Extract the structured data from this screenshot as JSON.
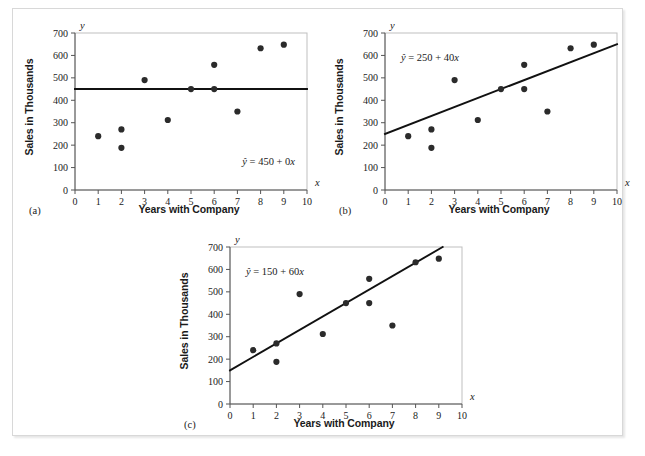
{
  "figure": {
    "panels": [
      {
        "tag": "(a)",
        "xlabel": "Years with Company",
        "ylabel": "Sales in Thousands",
        "x_axis_var": "x",
        "y_axis_var": "y",
        "equation_parts": {
          "yhat": "ŷ",
          "rest": " = 450 + 0",
          "var": "x"
        },
        "equation": "ŷ = 450 + 0x",
        "eq_pos": "bottom-right"
      },
      {
        "tag": "(b)",
        "xlabel": "Years with Company",
        "ylabel": "Sales in Thousands",
        "x_axis_var": "x",
        "y_axis_var": "y",
        "equation_parts": {
          "yhat": "ŷ",
          "rest": " = 250 + 40",
          "var": "x"
        },
        "equation": "ŷ = 250 + 40x",
        "eq_pos": "top-left"
      },
      {
        "tag": "(c)",
        "xlabel": "Years with Company",
        "ylabel": "Sales in Thousands",
        "x_axis_var": "x",
        "y_axis_var": "y",
        "equation_parts": {
          "yhat": "ŷ",
          "rest": " = 150 + 60",
          "var": "x"
        },
        "equation": "ŷ = 150 + 60x",
        "eq_pos": "top-left"
      }
    ]
  },
  "chart_data": [
    {
      "type": "scatter",
      "title": "",
      "subtitle": "(a)",
      "xlabel": "Years with Company",
      "ylabel": "Sales in Thousands",
      "xlim": [
        0,
        10
      ],
      "ylim": [
        0,
        700
      ],
      "xticks": [
        0,
        1,
        2,
        3,
        4,
        5,
        6,
        7,
        8,
        9,
        10
      ],
      "yticks": [
        0,
        100,
        200,
        300,
        400,
        500,
        600,
        700
      ],
      "grid": false,
      "legend": "none",
      "x": [
        1,
        2,
        2,
        3,
        4,
        5,
        6,
        6,
        7,
        8,
        9
      ],
      "y": [
        240,
        270,
        188,
        490,
        312,
        450,
        558,
        450,
        350,
        632,
        648
      ],
      "annotations": [
        "ŷ = 450 + 0x"
      ],
      "fit_line": {
        "label": "ŷ = 450 + 0x",
        "intercept": 450,
        "slope": 0,
        "x_start": 0,
        "x_end": 10,
        "y_start": 450,
        "y_end": 450
      }
    },
    {
      "type": "scatter",
      "title": "",
      "subtitle": "(b)",
      "xlabel": "Years with Company",
      "ylabel": "Sales in Thousands",
      "xlim": [
        0,
        10
      ],
      "ylim": [
        0,
        700
      ],
      "xticks": [
        0,
        1,
        2,
        3,
        4,
        5,
        6,
        7,
        8,
        9,
        10
      ],
      "yticks": [
        0,
        100,
        200,
        300,
        400,
        500,
        600,
        700
      ],
      "grid": false,
      "legend": "none",
      "x": [
        1,
        2,
        2,
        3,
        4,
        5,
        6,
        6,
        7,
        8,
        9
      ],
      "y": [
        240,
        270,
        188,
        490,
        312,
        450,
        558,
        450,
        350,
        632,
        648
      ],
      "annotations": [
        "ŷ = 250 + 40x"
      ],
      "fit_line": {
        "label": "ŷ = 250 + 40x",
        "intercept": 250,
        "slope": 40,
        "x_start": 0,
        "x_end": 10,
        "y_start": 250,
        "y_end": 650
      }
    },
    {
      "type": "scatter",
      "title": "",
      "subtitle": "(c)",
      "xlabel": "Years with Company",
      "ylabel": "Sales in Thousands",
      "xlim": [
        0,
        10
      ],
      "ylim": [
        0,
        700
      ],
      "xticks": [
        0,
        1,
        2,
        3,
        4,
        5,
        6,
        7,
        8,
        9,
        10
      ],
      "yticks": [
        0,
        100,
        200,
        300,
        400,
        500,
        600,
        700
      ],
      "grid": false,
      "legend": "none",
      "x": [
        1,
        2,
        2,
        3,
        4,
        5,
        6,
        6,
        7,
        8,
        9
      ],
      "y": [
        240,
        270,
        188,
        490,
        312,
        450,
        558,
        450,
        350,
        632,
        648
      ],
      "annotations": [
        "ŷ = 150 + 60x"
      ],
      "fit_line": {
        "label": "ŷ = 150 + 60x",
        "intercept": 150,
        "slope": 60,
        "x_start": 0,
        "x_end": 9.2,
        "y_start": 150,
        "y_end": 702
      }
    }
  ],
  "style": {
    "point_color": "#2b2b2b",
    "line_color": "#111111",
    "frame_color": "#bfbfbf",
    "axis_color": "#555555",
    "text_color": "#1a1a1a",
    "background": "#ffffff"
  }
}
